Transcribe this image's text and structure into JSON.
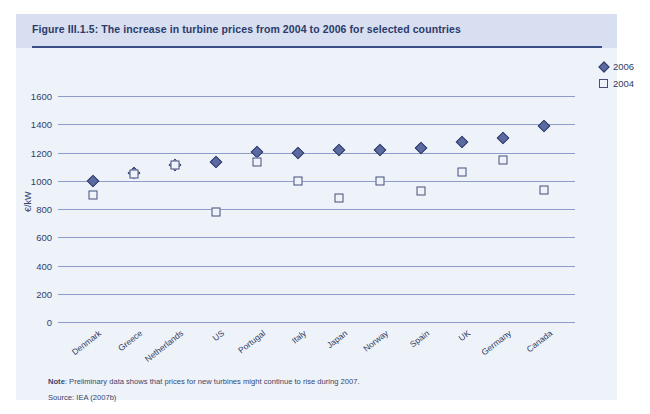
{
  "figure": {
    "title": "Figure III.1.5: The increase in turbine prices from 2004 to 2006 for selected countries",
    "note_label": "Note",
    "note_text": ": Preliminary data shows that prices for new turbines might continue to rise during 2007.",
    "source_text": "Source: IEA (2007b)"
  },
  "legend": {
    "items": [
      {
        "label": "2006",
        "marker": "filled-diamond",
        "color": "#5b6aa0"
      },
      {
        "label": "2004",
        "marker": "open-square",
        "color": "#444f7a"
      }
    ]
  },
  "colors": {
    "card_background": "#eef3f9",
    "header_background": "#d7dff0",
    "title_text": "#2b3a6b",
    "rule": "#3b4e86",
    "gridline": "#6e7fb5",
    "series_2006": "#5b6aa0",
    "series_2004": "#444f7a"
  },
  "chart_data": {
    "type": "scatter",
    "title": "Figure III.1.5: The increase in turbine prices from 2004 to 2006 for selected countries",
    "xlabel": "",
    "ylabel": "€/kW",
    "ylim": [
      0,
      1600
    ],
    "yticks": [
      0,
      200,
      400,
      600,
      800,
      1000,
      1200,
      1400,
      1600
    ],
    "grid": true,
    "legend_position": "right-top",
    "categories": [
      "Denmark",
      "Greece",
      "Netherlands",
      "US",
      "Portugal",
      "Italy",
      "Japan",
      "Norway",
      "Spain",
      "UK",
      "Germany",
      "Canada"
    ],
    "series": [
      {
        "name": "2006",
        "marker": "filled-diamond",
        "values": [
          995,
          1055,
          1115,
          1130,
          1205,
          1200,
          1215,
          1220,
          1230,
          1275,
          1300,
          1385
        ]
      },
      {
        "name": "2004",
        "marker": "open-square",
        "values": [
          900,
          1050,
          1115,
          780,
          1130,
          1000,
          875,
          995,
          930,
          1065,
          1145,
          935
        ]
      }
    ]
  }
}
